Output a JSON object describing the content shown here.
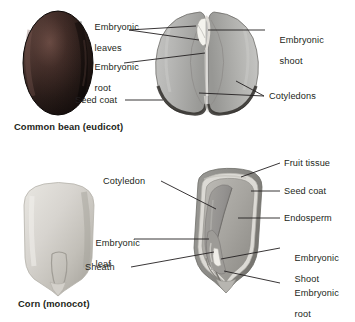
{
  "figure": {
    "background_color": "#ffffff",
    "text_color": "#231f20",
    "leader_line_color": "#231f20"
  },
  "panels": [
    {
      "id": "bean",
      "caption": "Common bean (eudicot)",
      "whole_seed": {
        "name": "whole-bean-seed",
        "description": "Dark reddish-brown whole bean seed, oval",
        "fill_dark": "#1c1412",
        "fill_mid": "#33231f",
        "highlight": "#5a403a"
      },
      "split_seed": {
        "name": "split-bean-seed",
        "description": "Bean split open showing two cotyledons and embryo",
        "cotyledon_fill": "#b4b4b2",
        "cotyledon_shade": "#9a9a98",
        "seed_coat_fill": "#3f3b38",
        "embryo_fill": "#f2f1ec"
      },
      "labels": [
        {
          "id": "bean-embryonic-leaves",
          "text": "Embryonic\nleaves",
          "side": "left"
        },
        {
          "id": "bean-embryonic-root",
          "text": "Embryonic\nroot",
          "side": "left"
        },
        {
          "id": "bean-seed-coat",
          "text": "Seed coat",
          "side": "left"
        },
        {
          "id": "bean-embryonic-shoot",
          "text": "Embryonic\nshoot",
          "side": "right"
        },
        {
          "id": "bean-cotyledons",
          "text": "Cotyledons",
          "side": "right"
        }
      ]
    },
    {
      "id": "corn",
      "caption": "Corn (monocot)",
      "whole_seed": {
        "name": "whole-corn-kernel",
        "description": "Pale gray corn kernel, rounded tooth shape",
        "fill_light": "#dedcd7",
        "fill_mid": "#c9c6c0",
        "fill_shade": "#b0ada6"
      },
      "split_seed": {
        "name": "corn-kernel-section",
        "description": "Corn kernel longitudinal section showing endosperm and embryo",
        "fruit_tissue_fill": "#8e8d8a",
        "seed_coat_fill": "#d9d7d2",
        "endosperm_fill": "#a8a6a2",
        "cotyledon_fill": "#999793",
        "embryo_fill": "#eceae5"
      },
      "labels": [
        {
          "id": "corn-cotyledon",
          "text": "Cotyledon",
          "side": "left"
        },
        {
          "id": "corn-embryonic-leaf",
          "text": "Embryonic\nleaf",
          "side": "left"
        },
        {
          "id": "corn-sheath",
          "text": "Sheath",
          "side": "left"
        },
        {
          "id": "corn-fruit-tissue",
          "text": "Fruit tissue",
          "side": "right"
        },
        {
          "id": "corn-seed-coat",
          "text": "Seed coat",
          "side": "right"
        },
        {
          "id": "corn-endosperm",
          "text": "Endosperm",
          "side": "right"
        },
        {
          "id": "corn-embryonic-shoot",
          "text": "Embryonic\nShoot",
          "side": "right"
        },
        {
          "id": "corn-embryonic-root",
          "text": "Embryonic\nroot",
          "side": "right"
        }
      ]
    }
  ],
  "text": {
    "bean_caption": "Common bean (eudicot)",
    "corn_caption": "Corn (monocot)",
    "bean_embryonic_leaves_1": "Embryonic",
    "bean_embryonic_leaves_2": "leaves",
    "bean_embryonic_root_1": "Embryonic",
    "bean_embryonic_root_2": "root",
    "bean_seed_coat": "Seed coat",
    "bean_embryonic_shoot_1": "Embryonic",
    "bean_embryonic_shoot_2": "shoot",
    "bean_cotyledons": "Cotyledons",
    "corn_cotyledon": "Cotyledon",
    "corn_embryonic_leaf_1": "Embryonic",
    "corn_embryonic_leaf_2": "leaf",
    "corn_sheath": "Sheath",
    "corn_fruit_tissue": "Fruit tissue",
    "corn_seed_coat": "Seed coat",
    "corn_endosperm": "Endosperm",
    "corn_embryonic_shoot_1": "Embryonic",
    "corn_embryonic_shoot_2": "Shoot",
    "corn_embryonic_root_1": "Embryonic",
    "corn_embryonic_root_2": "root"
  }
}
